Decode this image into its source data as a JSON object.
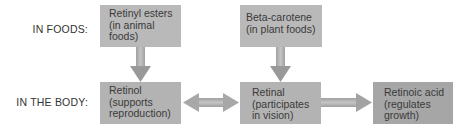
{
  "rows": {
    "foods_label": "IN FOODS:",
    "body_label": "IN THE BODY:"
  },
  "boxes": [
    {
      "id": "retinyl-esters",
      "lines": [
        "Retinyl esters",
        "(in animal",
        "foods)"
      ],
      "color": "#b9b9b9"
    },
    {
      "id": "beta-carotene",
      "lines": [
        "Beta-carotene",
        "(in plant foods)"
      ],
      "color": "#b9b9b9"
    },
    {
      "id": "retinol",
      "lines": [
        "Retinol",
        "(supports",
        "reproduction)"
      ],
      "color": "#b3b3b3"
    },
    {
      "id": "retinal",
      "lines": [
        "Retinal",
        "(participates",
        "in vision)"
      ],
      "color": "#b3b3b3"
    },
    {
      "id": "retinoic-acid",
      "lines": [
        "Retinoic acid",
        "(regulates",
        "growth)"
      ],
      "color": "#a6a6a6"
    }
  ],
  "arrows": [
    {
      "from": "retinyl-esters",
      "to": "retinol",
      "type": "one-way"
    },
    {
      "from": "beta-carotene",
      "to": "retinal",
      "type": "one-way"
    },
    {
      "from": "retinol",
      "to": "retinal",
      "type": "two-way"
    },
    {
      "from": "retinal",
      "to": "retinoic-acid",
      "type": "one-way"
    }
  ],
  "colors": {
    "arrow": "#a4a4a4",
    "background": "#ffffff"
  }
}
